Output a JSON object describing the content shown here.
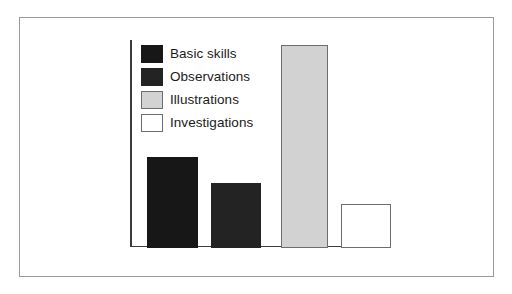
{
  "chart_data": {
    "type": "bar",
    "title": "",
    "subtitle": "",
    "xlabel": "",
    "ylabel": "",
    "grid": false,
    "legend_position": "top-left",
    "axis": {
      "x_tick_labels": [],
      "y_tick_labels": [],
      "ylim": [
        0,
        210
      ]
    },
    "categories": [
      "Basic skills",
      "Observations",
      "Illustrations",
      "Investigations"
    ],
    "series": [
      {
        "name": "Activity type",
        "values": [
          91,
          65,
          203,
          44
        ]
      }
    ],
    "bars": [
      {
        "label": "Basic skills",
        "value": 91,
        "fill": "#171717",
        "stroke": "#171717",
        "left": 17,
        "width": 51
      },
      {
        "label": "Observations",
        "value": 65,
        "fill": "#232323",
        "stroke": "#232323",
        "left": 81,
        "width": 50
      },
      {
        "label": "Illustrations",
        "value": 203,
        "fill": "#d2d2d2",
        "stroke": "#6e6e6e",
        "left": 151,
        "width": 47
      },
      {
        "label": "Investigations",
        "value": 44,
        "fill": "#ffffff",
        "stroke": "#6e6e6e",
        "left": 211,
        "width": 50
      }
    ]
  },
  "legend": {
    "items": [
      {
        "label": "Basic skills",
        "fill": "#171717",
        "stroke": "#171717"
      },
      {
        "label": "Observations",
        "fill": "#232323",
        "stroke": "#232323"
      },
      {
        "label": "Illustrations",
        "fill": "#d2d2d2",
        "stroke": "#6e6e6e"
      },
      {
        "label": "Investigations",
        "fill": "#ffffff",
        "stroke": "#6e6e6e"
      }
    ]
  },
  "style": {
    "background": "#ffffff",
    "frame_color": "#9a9a9a",
    "axis_color": "#3c3c3c",
    "text_color": "#1b1b1b"
  }
}
